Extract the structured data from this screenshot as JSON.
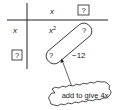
{
  "grid": {
    "col_headers": [
      "x",
      "?"
    ],
    "row_headers": [
      "x",
      "?"
    ],
    "cells": [
      [
        "x²",
        "?"
      ],
      [
        "?",
        "−12"
      ]
    ],
    "cell_x2_base": "x",
    "cell_x2_exp": "2"
  },
  "annotation": {
    "callout_text": "add to give 4x",
    "callout_prefix": "add to give 4",
    "callout_var": "x"
  },
  "colors": {
    "ink": "#222222",
    "background": "#ffffff"
  }
}
